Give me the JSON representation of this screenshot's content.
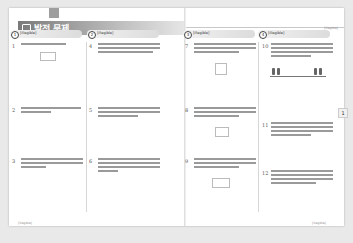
{
  "page": {
    "title": "발전 문제",
    "running_head_right": "[illegible]",
    "side_tab": "1",
    "footer_left": "[illegible]",
    "footer_right": "[illegible]"
  },
  "sections": [
    {
      "num": "1",
      "title": "[illegible]"
    },
    {
      "num": "2",
      "title": "[illegible]"
    },
    {
      "num": "3",
      "title": "[illegible]"
    },
    {
      "num": "4",
      "title": "[illegible]"
    }
  ],
  "problems": {
    "col1": [
      {
        "num": "1",
        "text": "[illegible]"
      },
      {
        "num": "2",
        "text": "[illegible]"
      },
      {
        "num": "3",
        "text": "[illegible]"
      }
    ],
    "col2": [
      {
        "num": "4",
        "text": "[illegible]"
      },
      {
        "num": "5",
        "text": "[illegible]"
      },
      {
        "num": "6",
        "text": "[illegible]"
      }
    ],
    "col3": [
      {
        "num": "7",
        "text": "[illegible]"
      },
      {
        "num": "8",
        "text": "[illegible]"
      },
      {
        "num": "9",
        "text": "[illegible]"
      }
    ],
    "col4": [
      {
        "num": "10",
        "text": "[illegible]"
      },
      {
        "num": "11",
        "text": "[illegible]"
      },
      {
        "num": "12",
        "text": "[illegible]"
      }
    ]
  },
  "colors": {
    "title_bar_start": "#7a7a7a",
    "title_bar_end": "#e6e6e6",
    "section_header": "#dcdcdc",
    "background": "#e9e9e9",
    "page": "#ffffff"
  }
}
